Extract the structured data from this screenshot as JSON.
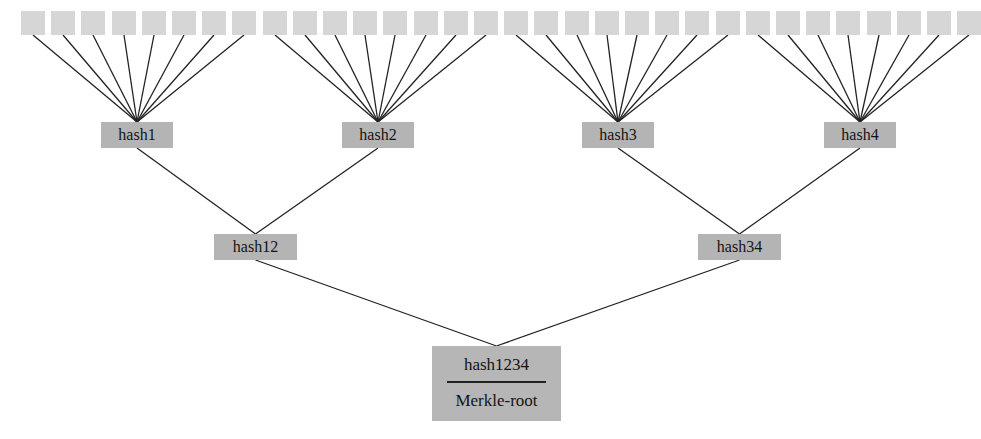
{
  "diagram": {
    "colors": {
      "leaf": "#d6d6d6",
      "node": "#b4b4b4",
      "edge": "#222222",
      "text": "#141414"
    },
    "leaf_count": 32,
    "leaves_per_group": 8,
    "level1": [
      {
        "label": "hash1",
        "x": 101,
        "y": 122,
        "w": 72,
        "h": 26
      },
      {
        "label": "hash2",
        "x": 342,
        "y": 122,
        "w": 72,
        "h": 26
      },
      {
        "label": "hash3",
        "x": 582,
        "y": 122,
        "w": 72,
        "h": 26
      },
      {
        "label": "hash4",
        "x": 824,
        "y": 122,
        "w": 72,
        "h": 26
      }
    ],
    "level2": [
      {
        "label": "hash12",
        "x": 214,
        "y": 234,
        "w": 83,
        "h": 26
      },
      {
        "label": "hash34",
        "x": 698,
        "y": 234,
        "w": 83,
        "h": 26
      }
    ],
    "root": {
      "label": "hash1234",
      "sublabel": "Merkle-root",
      "x": 432,
      "y": 346,
      "w": 129,
      "h": 75
    }
  }
}
